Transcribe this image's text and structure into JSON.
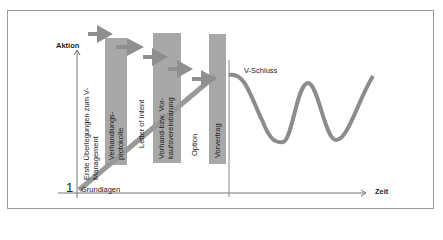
{
  "axes": {
    "y_label": "Aktion",
    "x_label": "Zeit",
    "origin_number": "1",
    "origin_label": "Grundlagen"
  },
  "phases": [
    {
      "label_line1": "Erste Überlegungen zum V-",
      "label_line2": "Management",
      "has_bar": false
    },
    {
      "label_line1": "Verhandlungs-",
      "label_line2": "protokolle",
      "has_bar": true
    },
    {
      "label_line1": "Letter of Intent",
      "label_line2": "",
      "has_bar": false
    },
    {
      "label_line1": "Vorhand-bzw. Vor-",
      "label_line2": "kaufsvereinbarung",
      "has_bar": true
    },
    {
      "label_line1": "Option",
      "label_line2": "",
      "has_bar": false
    },
    {
      "label_line1": "Vorvertrag",
      "label_line2": "",
      "has_bar": true
    }
  ],
  "milestone": {
    "label": "V-Schluss"
  },
  "colors": {
    "bar": "#a8a8a8",
    "arrow": "#8f8f8f",
    "curve": "#8c8c8c",
    "axis": "#777777",
    "frame": "#9a9a9a"
  }
}
